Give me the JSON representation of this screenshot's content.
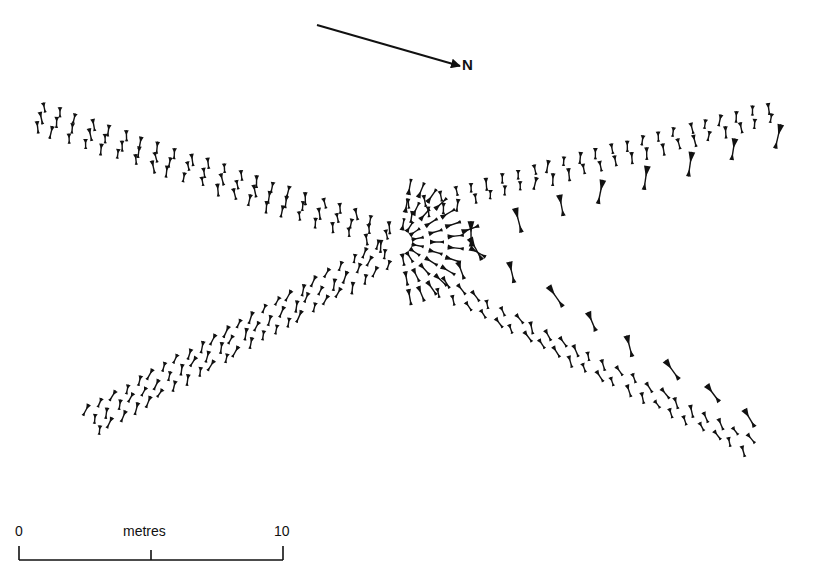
{
  "diagram": {
    "type": "archaeological-plan",
    "ink_color": "#111111",
    "background": "#ffffff"
  },
  "north_arrow": {
    "label": "N",
    "from": [
      317,
      25
    ],
    "to": [
      460,
      66
    ]
  },
  "scale_bar": {
    "start_label": "0",
    "unit_label": "metres",
    "end_label": "10",
    "x_start": 19,
    "x_mid": 151,
    "x_end": 283,
    "y": 560
  },
  "arms": [
    {
      "name": "north-west-arm",
      "from": [
        40,
        112
      ],
      "to": [
        385,
        230
      ],
      "rows": 3,
      "count": 22,
      "spacing": 6
    },
    {
      "name": "north-east-arm",
      "from": [
        410,
        205
      ],
      "to": [
        770,
        108
      ],
      "rows": 2,
      "count": 24,
      "spacing": 8
    },
    {
      "name": "south-west-arm",
      "from": [
        95,
        415
      ],
      "to": [
        385,
        250
      ],
      "rows": 3,
      "count": 24,
      "spacing": 7
    },
    {
      "name": "south-east-arm",
      "from": [
        440,
        282
      ],
      "to": [
        745,
        440
      ],
      "rows": 2,
      "count": 22,
      "spacing": 8
    },
    {
      "name": "east-outer-row",
      "from": [
        470,
        222
      ],
      "to": [
        780,
        125
      ],
      "rows": 1,
      "count": 8,
      "spacing": 0
    },
    {
      "name": "south-east-outer-row",
      "from": [
        470,
        238
      ],
      "to": [
        745,
        410
      ],
      "rows": 1,
      "count": 8,
      "spacing": 0
    }
  ]
}
